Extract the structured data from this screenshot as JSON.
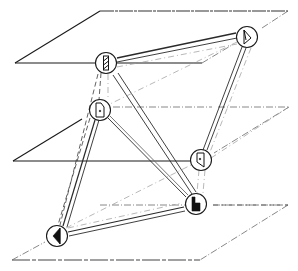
{
  "diagram": {
    "colors": {
      "ink": "#1a1a1a",
      "faint": "#9a9a9a",
      "background": "#ffffff"
    },
    "planes": [
      {
        "id": "top",
        "label": "",
        "points": [
          [
            100,
            11
          ],
          [
            288,
            11
          ],
          [
            202,
            63
          ],
          [
            15,
            63
          ]
        ]
      },
      {
        "id": "middle",
        "label": "",
        "points": [
          [
            82,
            87
          ],
          [
            289,
            107
          ],
          [
            190,
            161
          ],
          [
            13,
            161
          ]
        ]
      },
      {
        "id": "bottom",
        "label": "",
        "points": [
          [
            100,
            205
          ],
          [
            288,
            205
          ],
          [
            200,
            260
          ],
          [
            12,
            260
          ]
        ]
      }
    ],
    "nodes": [
      {
        "id": "A",
        "plane": "top",
        "x": 106,
        "y": 63,
        "glyph": "striped-bar-icon"
      },
      {
        "id": "B",
        "plane": "top",
        "x": 247,
        "y": 37,
        "glyph": "right-triangle-icon"
      },
      {
        "id": "C",
        "plane": "middle",
        "x": 100,
        "y": 110,
        "glyph": "door-icon"
      },
      {
        "id": "D",
        "plane": "middle",
        "x": 201,
        "y": 160,
        "glyph": "flag-door-icon"
      },
      {
        "id": "E",
        "plane": "bottom",
        "x": 196,
        "y": 204,
        "glyph": "stepped-block-icon"
      },
      {
        "id": "F",
        "plane": "bottom",
        "x": 57,
        "y": 236,
        "glyph": "left-triangle-icon"
      }
    ],
    "edges": [
      {
        "from": "A",
        "to": "B",
        "style": "double-solid"
      },
      {
        "from": "A",
        "to": "C",
        "style": "dashed"
      },
      {
        "from": "A",
        "to": "E",
        "style": "double-solid"
      },
      {
        "from": "A",
        "to": "F",
        "style": "dashed"
      },
      {
        "from": "B",
        "to": "D",
        "style": "double-solid"
      },
      {
        "from": "B",
        "to": "C",
        "style": "faint-dashed"
      },
      {
        "from": "C",
        "to": "D",
        "style": "faint-dashed"
      },
      {
        "from": "C",
        "to": "E",
        "style": "double-solid"
      },
      {
        "from": "C",
        "to": "F",
        "style": "double-solid"
      },
      {
        "from": "D",
        "to": "E",
        "style": "faint-dashed"
      },
      {
        "from": "F",
        "to": "E",
        "style": "double-solid"
      },
      {
        "from": "F",
        "to": "D",
        "style": "faint-dashed"
      }
    ]
  }
}
